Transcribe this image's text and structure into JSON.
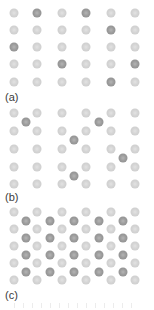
{
  "figure": {
    "colors": {
      "host_atom": "#d0d0d0",
      "dopant_atom": "#9a9a9a",
      "label": "#3a3a3a"
    },
    "panels": [
      {
        "id": "a",
        "label": "(a)",
        "description": "substitutional dopants on host lattice",
        "grid": {
          "cols": 6,
          "rows": 5
        },
        "substitutional": [
          [
            0,
            1
          ],
          [
            0,
            3
          ],
          [
            1,
            4
          ],
          [
            2,
            0
          ],
          [
            3,
            2
          ],
          [
            3,
            5
          ],
          [
            4,
            4
          ]
        ],
        "interstitial": []
      },
      {
        "id": "b",
        "label": "(b)",
        "description": "isolated interstitial dopants",
        "grid": {
          "cols": 6,
          "rows": 5
        },
        "substitutional": [],
        "interstitial": [
          [
            0,
            0
          ],
          [
            0,
            3
          ],
          [
            1,
            2
          ],
          [
            2,
            4
          ],
          [
            3,
            2
          ]
        ]
      },
      {
        "id": "c",
        "label": "(c)",
        "description": "fully occupied interstitial sublattice",
        "grid": {
          "cols": 6,
          "rows": 5
        },
        "substitutional": [],
        "interstitial": "all"
      }
    ]
  }
}
